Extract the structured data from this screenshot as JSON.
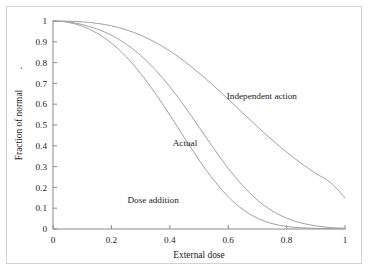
{
  "chart_data": {
    "type": "line",
    "title": "",
    "xlabel": "External dose",
    "ylabel": "Fraction of normal",
    "xlim": [
      0,
      1
    ],
    "ylim": [
      0,
      1
    ],
    "grid": false,
    "legend": "inline-annotations",
    "xticks": [
      "0",
      "0.2",
      "0.4",
      "0.6",
      "0.8",
      "1"
    ],
    "xtick_values": [
      0,
      0.2,
      0.4,
      0.6,
      0.8,
      1
    ],
    "yticks": [
      "0",
      "0.1",
      "0.2",
      "0.3",
      "0.4",
      "0.5",
      "0.6",
      "0.7",
      "0.8",
      "0.9",
      "1"
    ],
    "ytick_values": [
      0,
      0.1,
      0.2,
      0.3,
      0.4,
      0.5,
      0.6,
      0.7,
      0.8,
      0.9,
      1
    ],
    "x": [
      0,
      0.05,
      0.1,
      0.15,
      0.2,
      0.25,
      0.3,
      0.35,
      0.4,
      0.45,
      0.5,
      0.55,
      0.6,
      0.65,
      0.7,
      0.75,
      0.8,
      0.85,
      0.9,
      0.95,
      1
    ],
    "series": [
      {
        "name": "Independent action",
        "color": "#a0a0a0",
        "values": [
          1,
          0.999,
          0.996,
          0.989,
          0.977,
          0.958,
          0.932,
          0.898,
          0.856,
          0.806,
          0.75,
          0.689,
          0.624,
          0.558,
          0.492,
          0.429,
          0.37,
          0.316,
          0.267,
          0.224,
          0.15
        ]
      },
      {
        "name": "Actual",
        "color": "#a0a0a0",
        "values": [
          1,
          0.996,
          0.983,
          0.962,
          0.932,
          0.89,
          0.835,
          0.766,
          0.684,
          0.591,
          0.49,
          0.388,
          0.292,
          0.208,
          0.139,
          0.088,
          0.052,
          0.029,
          0.015,
          0.007,
          0.004
        ]
      },
      {
        "name": "Dose addition",
        "color": "#a0a0a0",
        "values": [
          1,
          0.994,
          0.975,
          0.942,
          0.894,
          0.829,
          0.748,
          0.653,
          0.548,
          0.439,
          0.332,
          0.236,
          0.155,
          0.094,
          0.052,
          0.026,
          0.012,
          0.006,
          0.003,
          0.002,
          0.001
        ]
      }
    ],
    "annotations": [
      {
        "text": "Independent action",
        "x": 0.595,
        "y": 0.625
      },
      {
        "text": "Actual",
        "x": 0.41,
        "y": 0.4
      },
      {
        "text": "Dose addition",
        "x": 0.255,
        "y": 0.125
      }
    ]
  },
  "colors": {
    "frame": "#d2d2d2",
    "axis": "#8a8a8a",
    "curve": "#a0a0a0",
    "text": "#1a1a1a",
    "background": "#ffffff"
  }
}
